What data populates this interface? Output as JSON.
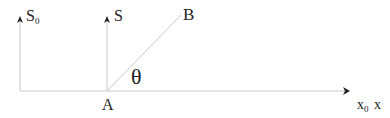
{
  "diagram": {
    "labels": {
      "s0_main": "S",
      "s0_sub": "0",
      "s": "S",
      "b": "B",
      "a": "A",
      "theta": "θ",
      "x0_main": "x",
      "x0_sub": "0",
      "x": "x"
    },
    "colors": {
      "line": "#c8c8c8",
      "arrow": "#222222",
      "text": "#222222"
    }
  }
}
